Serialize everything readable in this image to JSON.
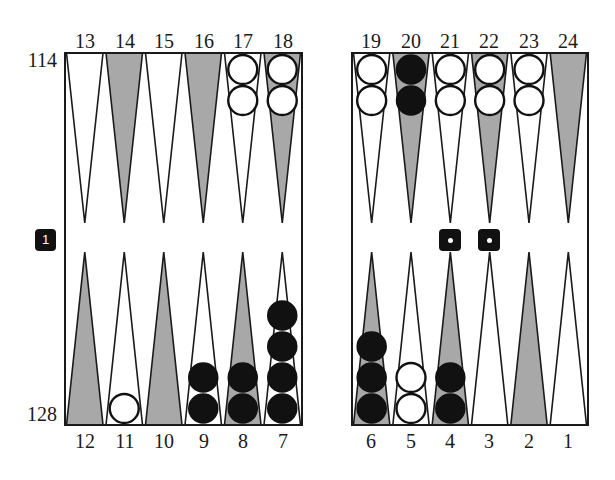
{
  "pip_counts": {
    "top_player": "114",
    "bottom_player": "128"
  },
  "cube": {
    "value": "1",
    "position": "left-center",
    "color": "#111111"
  },
  "dice": [
    {
      "value": 1,
      "pips": "•"
    },
    {
      "value": 1,
      "pips": "•"
    }
  ],
  "colors": {
    "dark_point": "#a8a8a8",
    "light_point": "#ffffff",
    "line": "#1a1a1a",
    "black_checker": "#111111",
    "white_checker": "#ffffff"
  },
  "boards": {
    "left": {
      "x0": 65,
      "x1": 302
    },
    "right": {
      "x0": 352,
      "x1": 588
    },
    "y_top": 53,
    "y_bottom": 425,
    "tip_top": 223,
    "tip_bottom": 252
  },
  "point_labels": {
    "top_left": [
      "13",
      "14",
      "15",
      "16",
      "17",
      "18"
    ],
    "top_right": [
      "19",
      "20",
      "21",
      "22",
      "23",
      "24"
    ],
    "bottom_left": [
      "12",
      "11",
      "10",
      "9",
      "8",
      "7"
    ],
    "bottom_right": [
      "6",
      "5",
      "4",
      "3",
      "2",
      "1"
    ]
  },
  "points": [
    {
      "point": 1,
      "shade": "light",
      "checkers": 0,
      "color": null
    },
    {
      "point": 2,
      "shade": "dark",
      "checkers": 0,
      "color": null
    },
    {
      "point": 3,
      "shade": "light",
      "checkers": 0,
      "color": null
    },
    {
      "point": 4,
      "shade": "dark",
      "checkers": 2,
      "color": "black"
    },
    {
      "point": 5,
      "shade": "light",
      "checkers": 2,
      "color": "white"
    },
    {
      "point": 6,
      "shade": "dark",
      "checkers": 3,
      "color": "black"
    },
    {
      "point": 7,
      "shade": "light",
      "checkers": 4,
      "color": "black"
    },
    {
      "point": 8,
      "shade": "dark",
      "checkers": 2,
      "color": "black"
    },
    {
      "point": 9,
      "shade": "light",
      "checkers": 2,
      "color": "black"
    },
    {
      "point": 10,
      "shade": "dark",
      "checkers": 0,
      "color": null
    },
    {
      "point": 11,
      "shade": "light",
      "checkers": 1,
      "color": "white"
    },
    {
      "point": 12,
      "shade": "dark",
      "checkers": 0,
      "color": null
    },
    {
      "point": 13,
      "shade": "light",
      "checkers": 0,
      "color": null
    },
    {
      "point": 14,
      "shade": "dark",
      "checkers": 0,
      "color": null
    },
    {
      "point": 15,
      "shade": "light",
      "checkers": 0,
      "color": null
    },
    {
      "point": 16,
      "shade": "dark",
      "checkers": 0,
      "color": null
    },
    {
      "point": 17,
      "shade": "light",
      "checkers": 2,
      "color": "white"
    },
    {
      "point": 18,
      "shade": "dark",
      "checkers": 2,
      "color": "white"
    },
    {
      "point": 19,
      "shade": "light",
      "checkers": 2,
      "color": "white"
    },
    {
      "point": 20,
      "shade": "dark",
      "checkers": 2,
      "color": "black"
    },
    {
      "point": 21,
      "shade": "light",
      "checkers": 2,
      "color": "white"
    },
    {
      "point": 22,
      "shade": "dark",
      "checkers": 2,
      "color": "white"
    },
    {
      "point": 23,
      "shade": "light",
      "checkers": 2,
      "color": "white"
    },
    {
      "point": 24,
      "shade": "dark",
      "checkers": 0,
      "color": null
    }
  ]
}
